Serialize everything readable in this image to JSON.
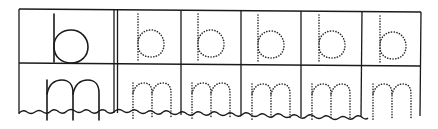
{
  "worksheet": {
    "title": "Letter tracing practice",
    "rows": [
      {
        "model_letter": "b",
        "trace_letters": [
          "b",
          "b",
          "b",
          "b",
          "b"
        ]
      },
      {
        "model_letter": "m",
        "trace_letters": [
          "m",
          "m",
          "m",
          "m",
          "m"
        ]
      }
    ],
    "colors": {
      "ink": "#1a1a1a",
      "paper": "#ffffff"
    }
  }
}
